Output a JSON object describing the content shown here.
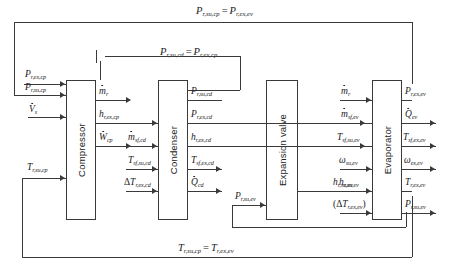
{
  "diagram": {
    "blocks": [
      {
        "id": "compressor",
        "label": "Compressor"
      },
      {
        "id": "condenser",
        "label": "Condenser"
      },
      {
        "id": "expansion_valve",
        "label": "Expansion valve"
      },
      {
        "id": "evaporator",
        "label": "Evaporator"
      }
    ],
    "equations": [
      {
        "id": "eq_top",
        "lhs": "P",
        "lhs_sub": "r,su,cp",
        "op": "=",
        "rhs": "P",
        "rhs_sub": "r,ex,ev"
      },
      {
        "id": "eq_mid",
        "lhs": "P",
        "lhs_sub": "r,su,cd",
        "op": "=",
        "rhs": "P",
        "rhs_sub": "r,ex,cp"
      },
      {
        "id": "eq_bottom",
        "lhs": "T",
        "lhs_sub": "r,su,cp",
        "op": "=",
        "rhs": "T",
        "rhs_sub": "r,ex,ev"
      }
    ],
    "compressor": {
      "inputs": [
        {
          "sym": "P",
          "sub": "r,ex,cp",
          "dot": false
        },
        {
          "sym": "P",
          "sub": "r,su,cp",
          "dot": false
        },
        {
          "sym": "V",
          "sub": "s",
          "dot": true
        },
        {
          "sym": "T",
          "sub": "r,su,cp",
          "dot": false
        }
      ],
      "outputs": [
        {
          "sym": "m",
          "sub": "r",
          "dot": true
        },
        {
          "sym": "h",
          "sub": "r,ex,cp",
          "dot": false
        },
        {
          "sym": "W",
          "sub": "cp",
          "dot": true
        }
      ]
    },
    "condenser": {
      "inputs": [
        {
          "sym": "m",
          "sub": "sf,cd",
          "dot": true,
          "delta": false
        },
        {
          "sym": "T",
          "sub": "sf,su,cd",
          "dot": false,
          "delta": false
        },
        {
          "sym": "T",
          "sub": "r,ex,cd",
          "dot": false,
          "delta": true
        }
      ],
      "outputs": [
        {
          "sym": "P",
          "sub": "r,su,cd",
          "dot": false
        },
        {
          "sym": "P",
          "sub": "r,ex,cd",
          "dot": false
        },
        {
          "sym": "h",
          "sub": "r,ex,cd",
          "dot": false
        },
        {
          "sym": "T",
          "sub": "sf,ex,cd",
          "dot": false
        },
        {
          "sym": "Q",
          "sub": "cd",
          "dot": true
        }
      ]
    },
    "expansion_valve": {
      "inputs": [
        {
          "sym": "P",
          "sub": "r,su,ev",
          "dot": false
        }
      ],
      "outputs": [
        {
          "sym": "h",
          "sub": "r,su,ev",
          "dot": false
        }
      ]
    },
    "evaporator": {
      "inputs": [
        {
          "sym": "m",
          "sub": "r",
          "dot": true,
          "paren": false,
          "delta": false
        },
        {
          "sym": "m",
          "sub": "sf,ev",
          "dot": true,
          "paren": false,
          "delta": false
        },
        {
          "sym": "T",
          "sub": "sf,su,ev",
          "dot": false,
          "paren": false,
          "delta": false
        },
        {
          "sym": "ω",
          "sub": "su,ev",
          "dot": false,
          "paren": false,
          "delta": false
        },
        {
          "sym": "h",
          "sub": "r,su,ev",
          "dot": false,
          "paren": false,
          "delta": false
        },
        {
          "sym": "T",
          "sub": "r,ex,ev",
          "dot": false,
          "paren": true,
          "delta": true
        }
      ],
      "outputs": [
        {
          "sym": "P",
          "sub": "r,ex,ev",
          "dot": false
        },
        {
          "sym": "Q",
          "sub": "ev",
          "dot": true
        },
        {
          "sym": "T",
          "sub": "sf,ex,ev",
          "dot": false
        },
        {
          "sym": "ω",
          "sub": "ex,ev",
          "dot": false
        },
        {
          "sym": "T",
          "sub": "r,ex,ev",
          "dot": false
        },
        {
          "sym": "P",
          "sub": "r,su,ev",
          "dot": false
        }
      ]
    },
    "colors": {
      "line": "#3a3a3a",
      "text": "#1a1a1a",
      "background": "#ffffff"
    }
  }
}
